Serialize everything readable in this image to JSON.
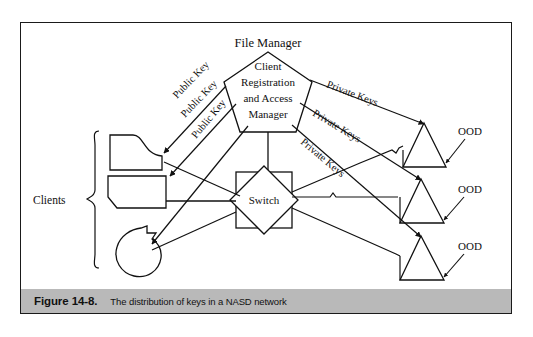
{
  "figure": {
    "caption_number": "Figure 14-8.",
    "caption_text": "The distribution of keys in a NASD network"
  },
  "diagram": {
    "type": "network-architecture-diagram",
    "title_node": "File Manager",
    "center_node": {
      "name": "cram-pentagon",
      "lines": [
        "Client",
        "Registration",
        "and Access",
        "Manager"
      ],
      "shape": "pentagon"
    },
    "switch_node": {
      "label": "Switch",
      "shape": "square-with-diamond"
    },
    "clients_group": {
      "label": "Clients",
      "brace": "{",
      "members": [
        {
          "name": "client-terminal",
          "shape": "curved-top-box"
        },
        {
          "name": "client-box",
          "shape": "clipped-corner-box"
        },
        {
          "name": "client-circle",
          "shape": "notched-circle"
        }
      ]
    },
    "ood_nodes": [
      {
        "label": "OOD",
        "shape": "triangle"
      },
      {
        "label": "OOD",
        "shape": "triangle"
      },
      {
        "label": "OOD",
        "shape": "triangle"
      }
    ],
    "public_key_labels": [
      "Public Key",
      "Public Key",
      "Public Key"
    ],
    "private_key_labels": [
      "Private Keys",
      "Private Keys",
      "Private Keys"
    ],
    "colors": {
      "stroke": "#111111",
      "background": "#ffffff",
      "caption_bar": "#b9b9b9",
      "frame": "#1a1a1a"
    }
  }
}
